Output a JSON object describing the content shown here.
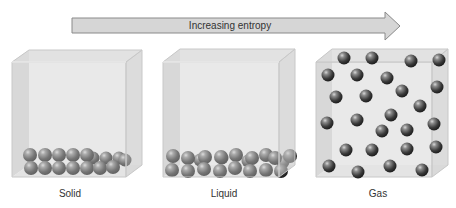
{
  "arrow": {
    "label": "Increasing entropy"
  },
  "states": [
    {
      "label": "Solid"
    },
    {
      "label": "Liquid"
    },
    {
      "label": "Gas"
    }
  ],
  "colors": {
    "arrow_fill": "#d6d6d6",
    "arrow_stroke": "#8a8a8a",
    "box_face": "#e9e9e9",
    "box_side": "#d4d4d4",
    "box_top": "#dcdcdc",
    "sphere": "#4a4a4a"
  }
}
